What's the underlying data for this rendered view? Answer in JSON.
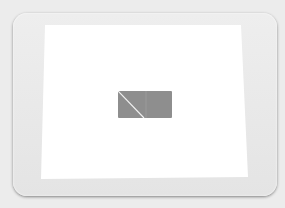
{
  "scene": {
    "description": "Photo of a tablet screen displaying a gray rectangle",
    "colors": {
      "background": "#ececec",
      "bezel": "#e6e6e6",
      "screen": "#ffffff",
      "shape": "#8e8e8e",
      "divider": "#f2f2f2"
    }
  }
}
